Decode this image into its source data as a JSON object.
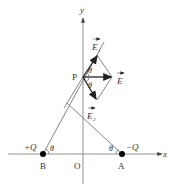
{
  "diagram": {
    "axes": {
      "x_label": "x",
      "y_label": "y",
      "origin_label": "O"
    },
    "points": {
      "P": {
        "label": "P"
      },
      "B": {
        "label": "B",
        "charge": "+Q"
      },
      "A": {
        "label": "A",
        "charge": "−Q"
      }
    },
    "vectors": {
      "E1": {
        "label": "E",
        "subscript": "1"
      },
      "E": {
        "label": "E"
      },
      "E2": {
        "label": "E",
        "subscript": "2"
      }
    },
    "angles": {
      "theta": "θ"
    },
    "colors": {
      "line": "#555555",
      "vector": "#222222",
      "charge": "#000000"
    }
  }
}
